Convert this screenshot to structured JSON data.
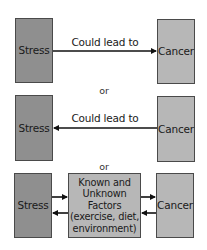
{
  "rows": [
    {
      "stress": "Stress",
      "cancer": "Cancer",
      "edge_label": "Could lead to",
      "direction": "stress-to-cancer"
    },
    {
      "stress": "Stress",
      "cancer": "Cancer",
      "edge_label": "Could lead to",
      "direction": "cancer-to-stress"
    },
    {
      "stress": "Stress",
      "cancer": "Cancer",
      "middle_lines": [
        "Known and",
        "Unknown",
        "Factors",
        "(exercise, diet,",
        "environment)"
      ],
      "direction": "bidirectional-via-factors"
    }
  ],
  "separators": [
    "or",
    "or"
  ],
  "colors": {
    "stress_fill": "#8f8f8f",
    "cancer_fill": "#b7b7b7",
    "factors_fill": "#b7b7b7",
    "border": "#4a4a4a",
    "arrow": "#111111"
  }
}
